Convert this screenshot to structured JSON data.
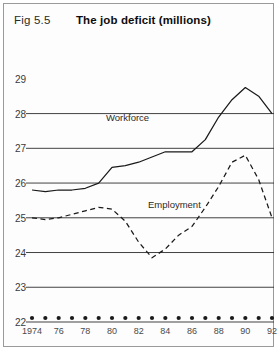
{
  "figure": {
    "number": "Fig 5.5",
    "title": "The job deficit (millions)"
  },
  "chart_data": {
    "type": "line",
    "title": "The job deficit (millions)",
    "xlabel": "",
    "ylabel": "",
    "ylim": [
      22,
      29.6
    ],
    "yticks": [
      22,
      23,
      24,
      25,
      26,
      27,
      28,
      29
    ],
    "gridlines": [
      22,
      23,
      24,
      25,
      26,
      27,
      28
    ],
    "grid": true,
    "legend": "inline-labels",
    "x": [
      1974,
      1975,
      1976,
      1977,
      1978,
      1979,
      1980,
      1981,
      1982,
      1983,
      1984,
      1985,
      1986,
      1987,
      1988,
      1989,
      1990,
      1991,
      1992
    ],
    "xtick_labels": [
      "1974",
      "",
      "76",
      "",
      "78",
      "",
      "80",
      "",
      "82",
      "",
      "84",
      "",
      "86",
      "",
      "88",
      "",
      "90",
      "",
      "92"
    ],
    "series": [
      {
        "name": "Workforce",
        "style": "solid",
        "color": "#1a1a1a",
        "values": [
          25.8,
          25.75,
          25.8,
          25.8,
          25.85,
          26.0,
          26.45,
          26.5,
          26.6,
          26.75,
          26.9,
          26.9,
          26.9,
          27.25,
          27.9,
          28.4,
          28.75,
          28.5,
          28.0
        ]
      },
      {
        "name": "Employment",
        "style": "dashed",
        "color": "#1a1a1a",
        "values": [
          25.0,
          24.95,
          25.0,
          25.1,
          25.2,
          25.3,
          25.25,
          24.9,
          24.3,
          23.85,
          24.1,
          24.5,
          24.75,
          25.3,
          25.9,
          26.6,
          26.8,
          26.1,
          25.0
        ]
      }
    ],
    "axis_dots": {
      "count": 19,
      "value": 22,
      "color": "#1a1a1a"
    }
  },
  "series_labels": {
    "workforce": "Workforce",
    "employment": "Employment"
  }
}
